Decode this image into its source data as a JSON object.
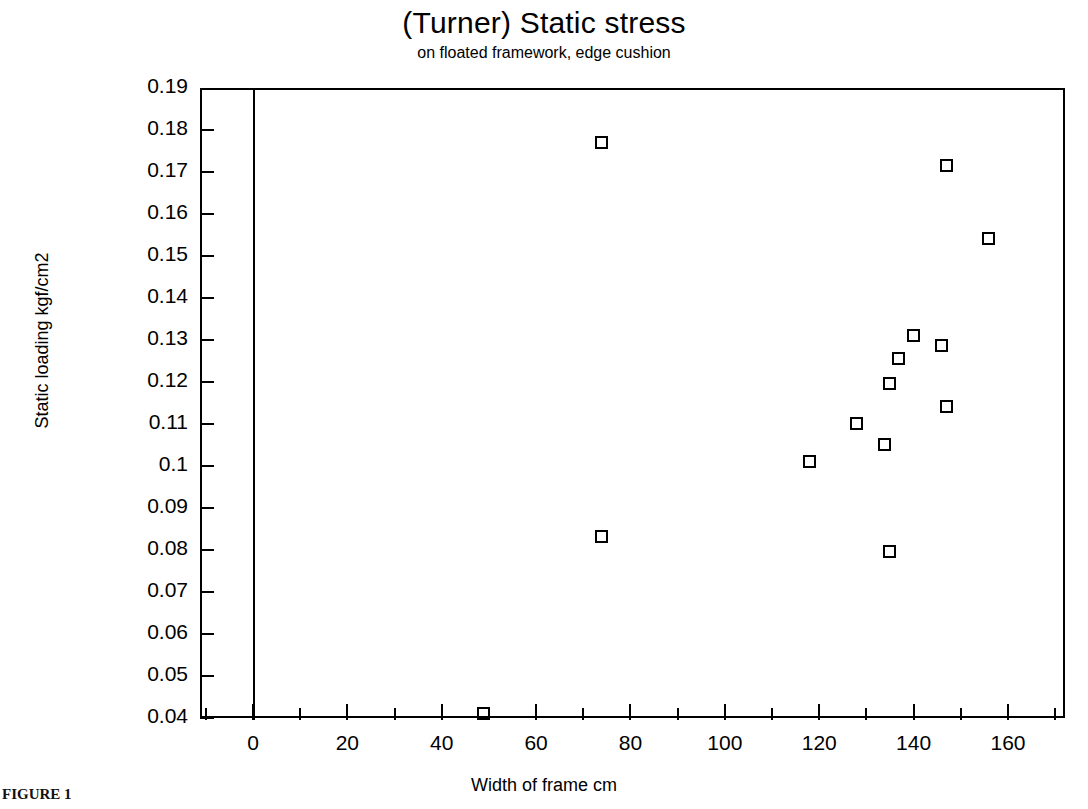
{
  "chart_data": {
    "type": "scatter",
    "title": "(Turner) Static stress",
    "subtitle": "on floated framework, edge cushion",
    "xlabel": "Width of frame cm",
    "ylabel": "Static loading kgf/cm2",
    "xlim": [
      -11,
      172
    ],
    "ylim": [
      0.04,
      0.19
    ],
    "grid": false,
    "legend": "none",
    "marker": "open-square",
    "marker_color": "#000000",
    "x_ticks": [
      0,
      20,
      40,
      60,
      80,
      100,
      120,
      140,
      160
    ],
    "x_tick_labels": [
      "0",
      "20",
      "40",
      "60",
      "80",
      "100",
      "120",
      "140",
      "160"
    ],
    "x_minor_ticks": [
      -10,
      10,
      30,
      50,
      70,
      90,
      110,
      130,
      150,
      170
    ],
    "y_ticks": [
      0.04,
      0.05,
      0.06,
      0.07,
      0.08,
      0.09,
      0.1,
      0.11,
      0.12,
      0.13,
      0.14,
      0.15,
      0.16,
      0.17,
      0.18,
      0.19
    ],
    "y_tick_labels": [
      "0.04",
      "0.05",
      "0.06",
      "0.07",
      "0.08",
      "0.09",
      "0.1",
      "0.11",
      "0.12",
      "0.13",
      "0.14",
      "0.15",
      "0.16",
      "0.17",
      "0.18",
      "0.19"
    ],
    "points": [
      {
        "x": 49,
        "y": 0.041
      },
      {
        "x": 74,
        "y": 0.083
      },
      {
        "x": 74,
        "y": 0.177
      },
      {
        "x": 118,
        "y": 0.101
      },
      {
        "x": 128,
        "y": 0.11
      },
      {
        "x": 134,
        "y": 0.105
      },
      {
        "x": 135,
        "y": 0.0795
      },
      {
        "x": 135,
        "y": 0.1195
      },
      {
        "x": 137,
        "y": 0.1255
      },
      {
        "x": 140,
        "y": 0.131
      },
      {
        "x": 146,
        "y": 0.1285
      },
      {
        "x": 147,
        "y": 0.114
      },
      {
        "x": 147,
        "y": 0.1715
      },
      {
        "x": 156,
        "y": 0.154
      }
    ],
    "series_name": "static loading vs width of frame"
  },
  "figure": {
    "caption_fragment": "FIGURE 1"
  }
}
